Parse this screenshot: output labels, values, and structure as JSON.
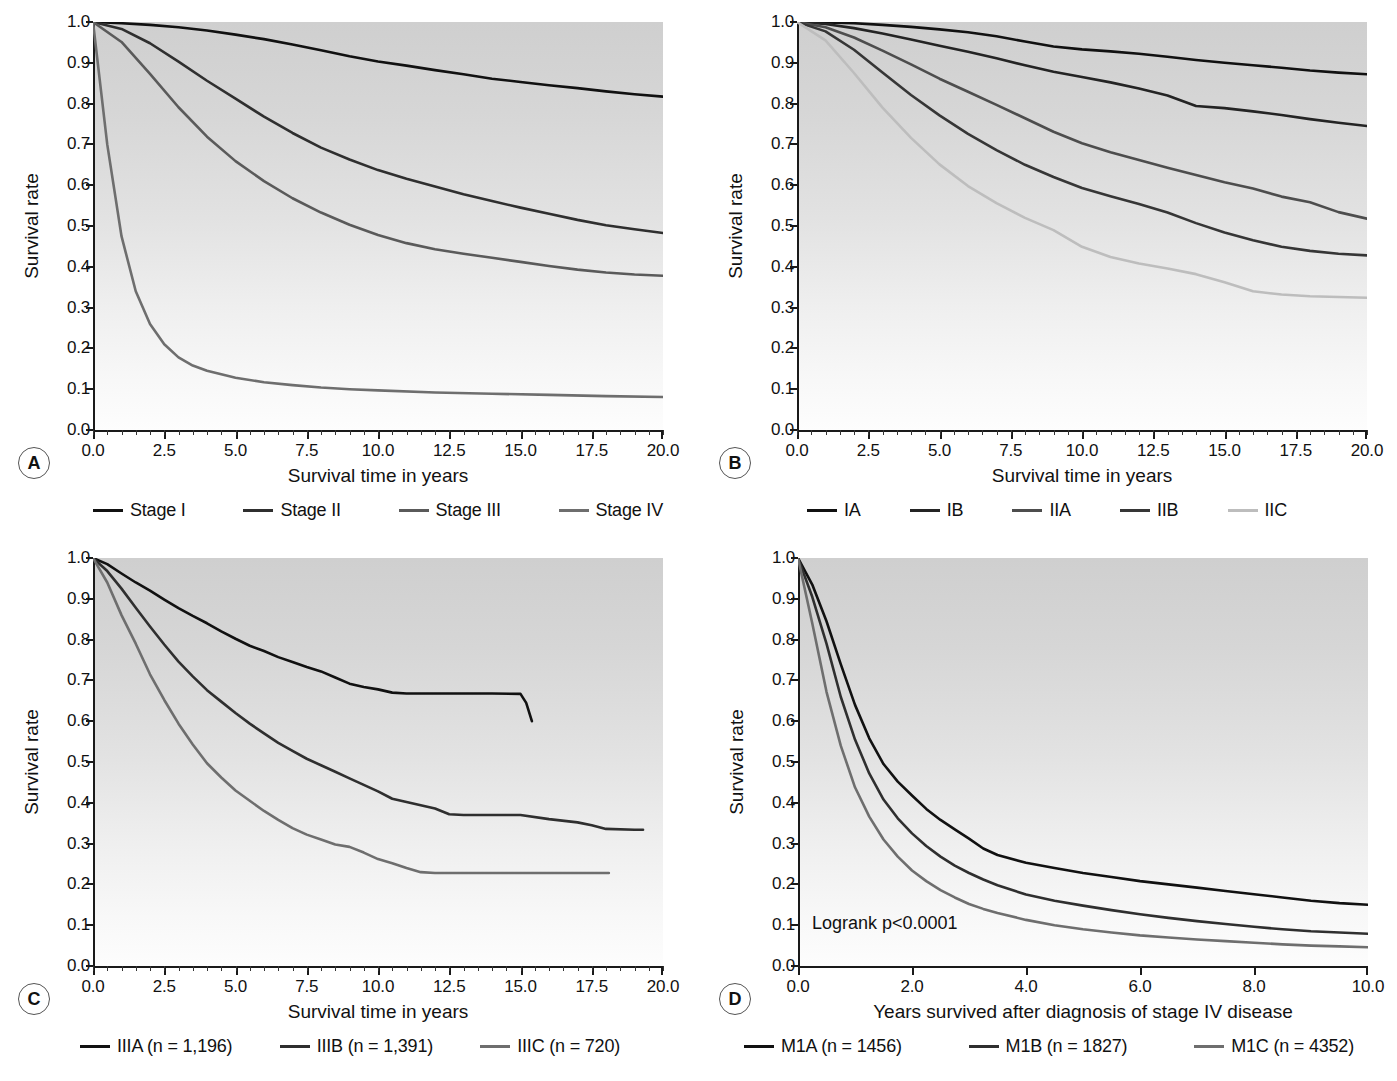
{
  "figure": {
    "background": "#ffffff"
  },
  "colors": {
    "c1": "#111111",
    "c2": "#2f2f2f",
    "c3": "#5a5a5a",
    "c4": "#7a7a7a",
    "c5": "#bdbdbd",
    "axis": "#1a1a1a"
  },
  "panels": [
    {
      "letter": "A",
      "xlabel": "Survival time in years",
      "ylabel": "Survival rate",
      "xticks": [
        "0.0",
        "2.5",
        "5.0",
        "7.5",
        "10.0",
        "12.5",
        "15.0",
        "17.5",
        "20.0"
      ],
      "yticks": [
        "0.0",
        "0.1",
        "0.2",
        "0.3",
        "0.4",
        "0.5",
        "0.6",
        "0.7",
        "0.8",
        "0.9",
        "1.0"
      ],
      "legend": [
        {
          "label": "Stage I",
          "color": "#111111"
        },
        {
          "label": "Stage II",
          "color": "#2f2f2f"
        },
        {
          "label": "Stage III",
          "color": "#5a5a5a"
        },
        {
          "label": "Stage IV",
          "color": "#6e6e6e"
        }
      ]
    },
    {
      "letter": "B",
      "xlabel": "Survival time in years",
      "ylabel": "Survival rate",
      "xticks": [
        "0.0",
        "2.5",
        "5.0",
        "7.5",
        "10.0",
        "12.5",
        "15.0",
        "17.5",
        "20.0"
      ],
      "yticks": [
        "0.0",
        "0.1",
        "0.2",
        "0.3",
        "0.4",
        "0.5",
        "0.6",
        "0.7",
        "0.8",
        "0.9",
        "1.0"
      ],
      "legend": [
        {
          "label": "IA",
          "color": "#111111"
        },
        {
          "label": "IB",
          "color": "#242424"
        },
        {
          "label": "IIA",
          "color": "#4d4d4d"
        },
        {
          "label": "IIB",
          "color": "#363636"
        },
        {
          "label": "IIC",
          "color": "#bdbdbd"
        }
      ]
    },
    {
      "letter": "C",
      "xlabel": "Survival time in years",
      "ylabel": "Survival rate",
      "xticks": [
        "0.0",
        "2.5",
        "5.0",
        "7.5",
        "10.0",
        "12.5",
        "15.0",
        "17.5",
        "20.0"
      ],
      "yticks": [
        "0.0",
        "0.1",
        "0.2",
        "0.3",
        "0.4",
        "0.5",
        "0.6",
        "0.7",
        "0.8",
        "0.9",
        "1.0"
      ],
      "legend": [
        {
          "label": "IIIA (n = 1,196)",
          "color": "#111111"
        },
        {
          "label": "IIIB (n = 1,391)",
          "color": "#2f2f2f"
        },
        {
          "label": "IIIC (n = 720)",
          "color": "#6e6e6e"
        }
      ]
    },
    {
      "letter": "D",
      "xlabel": "Years survived after diagnosis of stage IV disease",
      "ylabel": "Survival rate",
      "annotation": "Logrank p<0.0001",
      "xticks": [
        "0.0",
        "2.0",
        "4.0",
        "6.0",
        "8.0",
        "10.0"
      ],
      "yticks": [
        "0.0",
        "0.1",
        "0.2",
        "0.3",
        "0.4",
        "0.5",
        "0.6",
        "0.7",
        "0.8",
        "0.9",
        "1.0"
      ],
      "legend": [
        {
          "label": "M1A (n = 1456)",
          "color": "#111111"
        },
        {
          "label": "M1B (n = 1827)",
          "color": "#2f2f2f"
        },
        {
          "label": "M1C (n = 4352)",
          "color": "#6e6e6e"
        }
      ]
    }
  ],
  "chart_data": [
    {
      "panel": "A",
      "type": "line",
      "title": "",
      "xlabel": "Survival time in years",
      "ylabel": "Survival rate",
      "xlim": [
        0,
        20
      ],
      "ylim": [
        0,
        1.0
      ],
      "grid": false,
      "legend_position": "below",
      "series": [
        {
          "name": "Stage I",
          "color": "#111111",
          "x": [
            0,
            1,
            2,
            3,
            4,
            5,
            6,
            7,
            8,
            9,
            10,
            11,
            12,
            13,
            14,
            15,
            16,
            17,
            18,
            19,
            20
          ],
          "y": [
            1.0,
            0.997,
            0.993,
            0.987,
            0.979,
            0.969,
            0.958,
            0.945,
            0.931,
            0.916,
            0.903,
            0.893,
            0.882,
            0.872,
            0.861,
            0.853,
            0.845,
            0.838,
            0.83,
            0.823,
            0.817
          ]
        },
        {
          "name": "Stage II",
          "color": "#2f2f2f",
          "x": [
            0,
            1,
            2,
            3,
            4,
            5,
            6,
            7,
            8,
            9,
            10,
            11,
            12,
            13,
            14,
            15,
            16,
            17,
            18,
            19,
            20
          ],
          "y": [
            1.0,
            0.983,
            0.948,
            0.903,
            0.856,
            0.812,
            0.768,
            0.728,
            0.692,
            0.663,
            0.637,
            0.616,
            0.597,
            0.578,
            0.561,
            0.545,
            0.53,
            0.515,
            0.502,
            0.492,
            0.483
          ]
        },
        {
          "name": "Stage III",
          "color": "#5a5a5a",
          "x": [
            0,
            1,
            2,
            3,
            4,
            5,
            6,
            7,
            8,
            9,
            10,
            11,
            12,
            13,
            14,
            15,
            16,
            17,
            18,
            19,
            20
          ],
          "y": [
            1.0,
            0.951,
            0.873,
            0.791,
            0.719,
            0.659,
            0.61,
            0.568,
            0.533,
            0.503,
            0.478,
            0.458,
            0.443,
            0.432,
            0.422,
            0.412,
            0.402,
            0.393,
            0.386,
            0.381,
            0.378
          ]
        },
        {
          "name": "Stage IV",
          "color": "#6e6e6e",
          "x": [
            0,
            0.5,
            1,
            1.5,
            2,
            2.5,
            3,
            3.5,
            4,
            5,
            6,
            7,
            8,
            9,
            10,
            12,
            14,
            16,
            18,
            20
          ],
          "y": [
            1.0,
            0.7,
            0.475,
            0.34,
            0.26,
            0.21,
            0.178,
            0.158,
            0.145,
            0.128,
            0.117,
            0.11,
            0.104,
            0.1,
            0.097,
            0.092,
            0.089,
            0.086,
            0.083,
            0.081
          ]
        }
      ]
    },
    {
      "panel": "B",
      "type": "line",
      "title": "",
      "xlabel": "Survival time in years",
      "ylabel": "Survival rate",
      "xlim": [
        0,
        20
      ],
      "ylim": [
        0,
        1.0
      ],
      "grid": false,
      "legend_position": "below",
      "series": [
        {
          "name": "IA",
          "color": "#111111",
          "x": [
            0,
            1,
            2,
            3,
            4,
            5,
            6,
            7,
            8,
            9,
            10,
            11,
            12,
            13,
            14,
            15,
            16,
            17,
            18,
            19,
            20
          ],
          "y": [
            1.0,
            0.999,
            0.997,
            0.993,
            0.988,
            0.982,
            0.975,
            0.965,
            0.952,
            0.94,
            0.933,
            0.928,
            0.922,
            0.915,
            0.907,
            0.9,
            0.894,
            0.888,
            0.881,
            0.876,
            0.872
          ]
        },
        {
          "name": "IB",
          "color": "#242424",
          "x": [
            0,
            1,
            2,
            3,
            4,
            5,
            6,
            7,
            8,
            9,
            10,
            11,
            12,
            13,
            14,
            15,
            16,
            17,
            18,
            19,
            20
          ],
          "y": [
            1.0,
            0.995,
            0.985,
            0.972,
            0.957,
            0.942,
            0.927,
            0.911,
            0.894,
            0.878,
            0.865,
            0.852,
            0.837,
            0.82,
            0.794,
            0.789,
            0.781,
            0.772,
            0.762,
            0.753,
            0.745
          ]
        },
        {
          "name": "IIA",
          "color": "#4d4d4d",
          "x": [
            0,
            1,
            2,
            3,
            4,
            5,
            6,
            7,
            8,
            9,
            10,
            11,
            12,
            13,
            14,
            15,
            16,
            17,
            18,
            19,
            20
          ],
          "y": [
            1.0,
            0.987,
            0.962,
            0.93,
            0.896,
            0.861,
            0.829,
            0.797,
            0.764,
            0.731,
            0.703,
            0.681,
            0.662,
            0.643,
            0.625,
            0.607,
            0.592,
            0.572,
            0.558,
            0.534,
            0.518
          ]
        },
        {
          "name": "IIB",
          "color": "#363636",
          "x": [
            0,
            1,
            2,
            3,
            4,
            5,
            6,
            7,
            8,
            9,
            10,
            11,
            12,
            13,
            14,
            15,
            16,
            17,
            18,
            19,
            20
          ],
          "y": [
            1.0,
            0.977,
            0.932,
            0.876,
            0.821,
            0.771,
            0.726,
            0.686,
            0.65,
            0.62,
            0.593,
            0.573,
            0.554,
            0.533,
            0.507,
            0.484,
            0.465,
            0.449,
            0.439,
            0.432,
            0.428
          ]
        },
        {
          "name": "IIC",
          "color": "#bdbdbd",
          "x": [
            0,
            1,
            2,
            3,
            4,
            5,
            6,
            7,
            8,
            9,
            10,
            11,
            12,
            13,
            14,
            15,
            16,
            17,
            18,
            19,
            20
          ],
          "y": [
            1.0,
            0.955,
            0.875,
            0.79,
            0.716,
            0.651,
            0.598,
            0.556,
            0.52,
            0.49,
            0.449,
            0.424,
            0.408,
            0.396,
            0.382,
            0.362,
            0.34,
            0.332,
            0.328,
            0.326,
            0.324
          ]
        }
      ]
    },
    {
      "panel": "C",
      "type": "line",
      "title": "",
      "xlabel": "Survival time in years",
      "ylabel": "Survival rate",
      "xlim": [
        0,
        20
      ],
      "ylim": [
        0,
        1.0
      ],
      "grid": false,
      "legend_position": "below",
      "series": [
        {
          "name": "IIIA (n = 1,196)",
          "color": "#111111",
          "x": [
            0,
            0.5,
            1,
            1.5,
            2,
            2.5,
            3,
            3.5,
            4,
            4.5,
            5,
            5.5,
            6,
            6.5,
            7,
            7.5,
            8,
            8.5,
            9,
            9.5,
            10,
            10.5,
            11,
            12,
            13,
            14,
            15,
            15.2,
            15.4
          ],
          "y": [
            1.0,
            0.985,
            0.962,
            0.94,
            0.92,
            0.898,
            0.877,
            0.858,
            0.84,
            0.82,
            0.802,
            0.785,
            0.772,
            0.757,
            0.745,
            0.733,
            0.722,
            0.707,
            0.692,
            0.684,
            0.678,
            0.67,
            0.668,
            0.668,
            0.668,
            0.668,
            0.667,
            0.645,
            0.6
          ]
        },
        {
          "name": "IIIB (n = 1,391)",
          "color": "#2f2f2f",
          "x": [
            0,
            0.5,
            1,
            1.5,
            2,
            2.5,
            3,
            3.5,
            4,
            4.5,
            5,
            5.5,
            6,
            6.5,
            7,
            7.5,
            8,
            8.5,
            9,
            9.5,
            10,
            10.5,
            11,
            11.5,
            12,
            12.5,
            13,
            14,
            15,
            16,
            17,
            17.5,
            18,
            19,
            19.3
          ],
          "y": [
            1.0,
            0.968,
            0.925,
            0.878,
            0.832,
            0.788,
            0.746,
            0.71,
            0.676,
            0.648,
            0.62,
            0.594,
            0.57,
            0.547,
            0.527,
            0.508,
            0.492,
            0.476,
            0.46,
            0.444,
            0.428,
            0.41,
            0.402,
            0.394,
            0.386,
            0.372,
            0.37,
            0.37,
            0.37,
            0.36,
            0.352,
            0.345,
            0.336,
            0.334,
            0.334
          ]
        },
        {
          "name": "IIIC (n = 720)",
          "color": "#6e6e6e",
          "x": [
            0,
            0.5,
            1,
            1.5,
            2,
            2.5,
            3,
            3.5,
            4,
            4.5,
            5,
            5.5,
            6,
            6.5,
            7,
            7.5,
            8,
            8.5,
            9,
            9.5,
            10,
            10.5,
            11,
            11.5,
            12,
            14,
            16,
            18.1
          ],
          "y": [
            1.0,
            0.94,
            0.86,
            0.79,
            0.715,
            0.652,
            0.594,
            0.543,
            0.497,
            0.462,
            0.43,
            0.405,
            0.38,
            0.358,
            0.338,
            0.322,
            0.31,
            0.298,
            0.292,
            0.278,
            0.262,
            0.252,
            0.24,
            0.23,
            0.228,
            0.228,
            0.228,
            0.228
          ]
        }
      ]
    },
    {
      "panel": "D",
      "type": "line",
      "title": "",
      "xlabel": "Years survived after diagnosis of stage IV disease",
      "ylabel": "Survival rate",
      "xlim": [
        0,
        10
      ],
      "ylim": [
        0,
        1.0
      ],
      "grid": false,
      "legend_position": "below",
      "annotations": [
        "Logrank p<0.0001"
      ],
      "series": [
        {
          "name": "M1A (n = 1456)",
          "color": "#111111",
          "x": [
            0,
            0.25,
            0.5,
            0.75,
            1.0,
            1.25,
            1.5,
            1.75,
            2.0,
            2.25,
            2.5,
            2.75,
            3.0,
            3.25,
            3.5,
            4.0,
            4.5,
            5.0,
            5.5,
            6.0,
            6.5,
            7.0,
            7.5,
            8.0,
            8.5,
            9.0,
            9.5,
            10.0
          ],
          "y": [
            1.0,
            0.935,
            0.845,
            0.74,
            0.64,
            0.558,
            0.495,
            0.452,
            0.418,
            0.385,
            0.358,
            0.335,
            0.312,
            0.288,
            0.272,
            0.253,
            0.24,
            0.228,
            0.218,
            0.208,
            0.2,
            0.192,
            0.184,
            0.176,
            0.168,
            0.16,
            0.154,
            0.15
          ]
        },
        {
          "name": "M1B (n = 1827)",
          "color": "#2f2f2f",
          "x": [
            0,
            0.25,
            0.5,
            0.75,
            1.0,
            1.25,
            1.5,
            1.75,
            2.0,
            2.25,
            2.5,
            2.75,
            3.0,
            3.25,
            3.5,
            4.0,
            4.5,
            5.0,
            5.5,
            6.0,
            6.5,
            7.0,
            7.5,
            8.0,
            8.5,
            9.0,
            9.5,
            10.0
          ],
          "y": [
            1.0,
            0.905,
            0.79,
            0.66,
            0.555,
            0.472,
            0.408,
            0.362,
            0.325,
            0.294,
            0.268,
            0.246,
            0.228,
            0.212,
            0.198,
            0.175,
            0.16,
            0.148,
            0.137,
            0.127,
            0.118,
            0.11,
            0.103,
            0.096,
            0.09,
            0.085,
            0.082,
            0.079
          ]
        },
        {
          "name": "M1C (n = 4352)",
          "color": "#6e6e6e",
          "x": [
            0,
            0.25,
            0.5,
            0.75,
            1.0,
            1.25,
            1.5,
            1.75,
            2.0,
            2.25,
            2.5,
            2.75,
            3.0,
            3.25,
            3.5,
            4.0,
            4.5,
            5.0,
            5.5,
            6.0,
            6.5,
            7.0,
            7.5,
            8.0,
            8.5,
            9.0,
            9.5,
            10.0
          ],
          "y": [
            1.0,
            0.84,
            0.672,
            0.54,
            0.438,
            0.366,
            0.31,
            0.268,
            0.234,
            0.208,
            0.186,
            0.168,
            0.152,
            0.14,
            0.13,
            0.113,
            0.1,
            0.09,
            0.082,
            0.075,
            0.07,
            0.065,
            0.061,
            0.057,
            0.053,
            0.05,
            0.048,
            0.046
          ]
        }
      ]
    }
  ]
}
